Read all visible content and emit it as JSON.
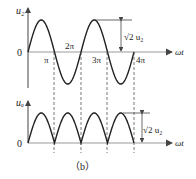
{
  "figure": {
    "caption": "（b）",
    "top_plot": {
      "y_label": "u₂",
      "x_label": "ωt",
      "origin_label": "0",
      "ticks": [
        "π",
        "2π",
        "3π",
        "4π"
      ],
      "amplitude_label": "√2 u₂",
      "waveform": "sine"
    },
    "bottom_plot": {
      "y_label": "uₒ",
      "x_label": "ωt",
      "origin_label": "0",
      "amplitude_label": "√2 u₂",
      "waveform": "full-wave rectified sine"
    }
  },
  "colors": {
    "stroke": "#222222",
    "axis": "#888888"
  }
}
